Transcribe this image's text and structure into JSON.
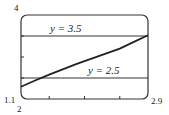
{
  "chart_data": {
    "type": "line",
    "title": "",
    "xlabel": "",
    "ylabel": "",
    "xlim": [
      1.1,
      2.9
    ],
    "ylim": [
      2,
      4
    ],
    "tick_labels": {
      "x_min": "1.1",
      "x_max": "2.9",
      "y_min": "2",
      "y_max": "4"
    },
    "x_ticks": [
      1.5,
      2.0,
      2.5
    ],
    "y_ticks": [
      2.5,
      3.0,
      3.5
    ],
    "grid": false,
    "series": [
      {
        "name": "f(x)",
        "x": [
          1.1,
          1.3,
          1.5,
          1.7,
          1.9,
          2.1,
          2.3,
          2.5,
          2.7,
          2.9
        ],
        "values": [
          2.29,
          2.44,
          2.58,
          2.71,
          2.84,
          2.96,
          3.08,
          3.2,
          3.36,
          3.52
        ]
      },
      {
        "name": "y = 3.5",
        "x": [
          1.1,
          2.9
        ],
        "values": [
          3.5,
          3.5
        ]
      },
      {
        "name": "y = 2.5",
        "x": [
          1.1,
          2.9
        ],
        "values": [
          2.5,
          2.5
        ]
      }
    ],
    "annotations": [
      {
        "text": "y = 3.5",
        "x": 1.55,
        "y": 3.6
      },
      {
        "text": "y = 2.5",
        "x": 2.25,
        "y": 2.6
      }
    ]
  },
  "labels": {
    "y_max": "4",
    "x_min": "1.1",
    "y_min": "2",
    "x_max": "2.9",
    "line_upper": "y = 3.5",
    "line_lower": "y = 2.5"
  }
}
